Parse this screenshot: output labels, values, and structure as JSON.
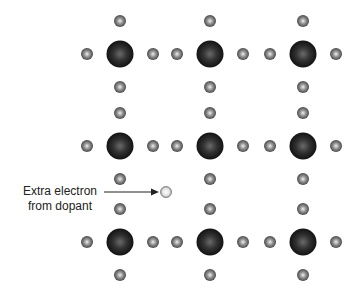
{
  "diagram": {
    "type": "crystal-lattice",
    "label_line1": "Extra electron",
    "label_line2": "from dopant",
    "colors": {
      "host_atom": "#1a1a1a",
      "valence_electron": "#555555",
      "extra_electron": "#dddddd",
      "arrow": "#222222"
    },
    "host_atoms": [
      {
        "x": 120,
        "y": 54
      },
      {
        "x": 210,
        "y": 54
      },
      {
        "x": 303,
        "y": 54
      },
      {
        "x": 120,
        "y": 146
      },
      {
        "x": 210,
        "y": 146
      },
      {
        "x": 303,
        "y": 146
      },
      {
        "x": 120,
        "y": 242
      },
      {
        "x": 210,
        "y": 242
      },
      {
        "x": 303,
        "y": 242
      }
    ],
    "extra_electron": {
      "x": 166,
      "y": 192
    }
  }
}
